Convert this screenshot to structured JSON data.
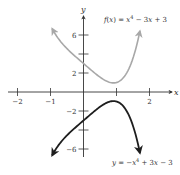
{
  "chart_data": {
    "type": "line",
    "title": "",
    "xlabel": "x",
    "ylabel": "y",
    "xlim": [
      -2.2,
      2.7
    ],
    "ylim": [
      -7,
      7.9
    ],
    "grid": false,
    "x_ticks": [
      -2,
      -1,
      1,
      2
    ],
    "x_tick_labels": [
      "−2",
      "−1",
      "",
      "2"
    ],
    "y_ticks": [
      6,
      4,
      2,
      -2,
      -4,
      -6
    ],
    "y_tick_labels": [
      "6",
      "",
      "2",
      "−2",
      "",
      "−6"
    ],
    "series": [
      {
        "name": "f(x) = x⁴ − 3x + 3",
        "expression": "x^4 - 3x + 3",
        "color": "#a8a8a8",
        "x_range": [
          -0.95,
          1.71
        ],
        "x": [
          -0.95,
          -0.5,
          0,
          0.5,
          0.91,
          1.25,
          1.5,
          1.71
        ],
        "values": [
          6.66,
          4.56,
          3.0,
          1.56,
          0.96,
          1.69,
          3.56,
          6.42
        ]
      },
      {
        "name": "y = −x⁴ + 3x − 3",
        "expression": "-x^4 + 3x - 3",
        "color": "#1e1e1e",
        "x_range": [
          -0.95,
          1.71
        ],
        "x": [
          -0.95,
          -0.5,
          0,
          0.5,
          0.91,
          1.25,
          1.5,
          1.71
        ],
        "values": [
          -6.66,
          -4.56,
          -3.0,
          -1.56,
          -0.96,
          -1.69,
          -3.56,
          -6.42
        ]
      }
    ],
    "annotations": [
      {
        "text": "f(x) = x⁴ − 3x + 3",
        "near": "upper-right"
      },
      {
        "text": "y = −x⁴ + 3x − 3",
        "near": "lower-right"
      }
    ]
  },
  "labels": {
    "x_axis": "x",
    "y_axis": "y",
    "upper_eq": "f(x) = x⁴ − 3x + 3",
    "lower_eq": "y = −x⁴ + 3x − 3"
  },
  "colors": {
    "axis": "#333333",
    "upper_curve": "#a8a8a8",
    "lower_curve": "#1e1e1e"
  }
}
